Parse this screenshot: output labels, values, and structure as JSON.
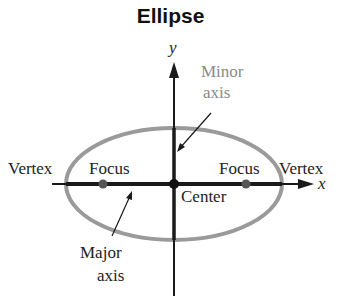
{
  "title": "Ellipse",
  "axes": {
    "x_label": "x",
    "y_label": "y"
  },
  "labels": {
    "minor_axis_line1": "Minor",
    "minor_axis_line2": "axis",
    "major_axis_line1": "Major",
    "major_axis_line2": "axis",
    "vertex_left": "Vertex",
    "vertex_right": "Vertex",
    "focus_left": "Focus",
    "focus_right": "Focus",
    "center": "Center"
  },
  "colors": {
    "ellipse": "#9a9a9a",
    "axis": "#1a1a1a",
    "gray_label": "#8a8a8a",
    "dark_label": "#222222"
  }
}
